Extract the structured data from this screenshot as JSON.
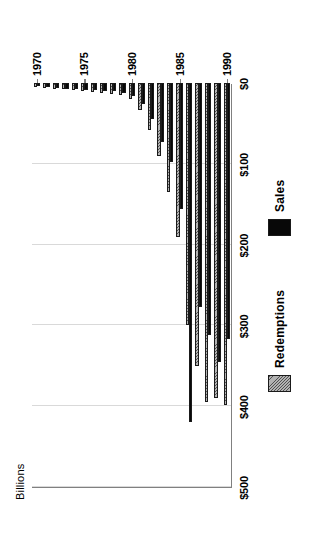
{
  "chart_data": {
    "type": "bar",
    "title": "",
    "subtitle": "",
    "xlabel": "",
    "ylabel": "Billions",
    "orientation": "vertical-bars-rotated-page",
    "grid": true,
    "legend_position": "bottom",
    "value_axis": {
      "label": "Billions",
      "min": 0,
      "max": 500,
      "tick_step": 100,
      "tick_labels": [
        "$0",
        "$100",
        "$200",
        "$300",
        "$400",
        "$500"
      ],
      "tick_values": [
        0,
        100,
        200,
        300,
        400,
        500
      ]
    },
    "category_axis": {
      "tick_labels": [
        "1970",
        "1975",
        "1980",
        "1985",
        "1990"
      ],
      "tick_values": [
        1970,
        1975,
        1980,
        1985,
        1990
      ]
    },
    "categories": [
      "1970",
      "1971",
      "1972",
      "1973",
      "1974",
      "1975",
      "1976",
      "1977",
      "1978",
      "1979",
      "1980",
      "1981",
      "1982",
      "1983",
      "1984",
      "1985",
      "1986",
      "1987",
      "1988",
      "1989",
      "1990"
    ],
    "series": [
      {
        "name": "Sales",
        "color": "#080808",
        "values": [
          4,
          5,
          6,
          7,
          8,
          9,
          9,
          10,
          10,
          12,
          16,
          26,
          44,
          73,
          98,
          156,
          420,
          277,
          312,
          345,
          317
        ]
      },
      {
        "name": "Redemptions",
        "color": "#b3b3b3",
        "pattern": "diagonal-hatch",
        "values": [
          5,
          6,
          7,
          8,
          9,
          10,
          11,
          12,
          13,
          15,
          20,
          33,
          58,
          90,
          135,
          190,
          300,
          350,
          395,
          390,
          398
        ]
      }
    ],
    "legend": [
      {
        "label": "Redemptions",
        "swatch": "hatched-gray"
      },
      {
        "label": "Sales",
        "swatch": "solid-black"
      }
    ]
  },
  "page": {
    "background": "#ffffff",
    "axis_color": "#808080",
    "grid_color": "#d9d9d9"
  }
}
